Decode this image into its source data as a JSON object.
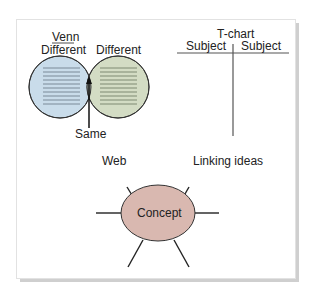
{
  "venn": {
    "title": "Venn",
    "left_label": "Different",
    "right_label": "Different",
    "overlap_label": "Same",
    "colors": {
      "left": "#c9dcea",
      "right": "#d3dcc4",
      "overlap": "#9aa29a"
    }
  },
  "tchart": {
    "title": "T-chart",
    "left_header": "Subject",
    "right_header": "Subject"
  },
  "web": {
    "label": "Web",
    "linking_label": "Linking ideas",
    "center_label": "Concept",
    "colors": {
      "center": "#d9b8b0"
    }
  }
}
